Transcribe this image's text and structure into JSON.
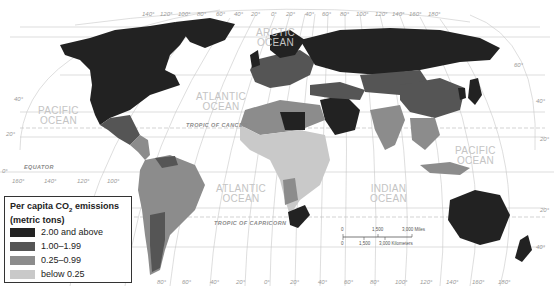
{
  "legend": {
    "title_prefix": "Per capita CO",
    "title_sub": "2",
    "title_suffix": " emissions",
    "subtitle": "(metric tons)",
    "items": [
      {
        "label": "2.00 and above",
        "color": "#222222"
      },
      {
        "label": "1.00–1.99",
        "color": "#555555"
      },
      {
        "label": "0.25–0.99",
        "color": "#8c8c8c"
      },
      {
        "label": "below 0.25",
        "color": "#c9c9c9"
      }
    ]
  },
  "oceans": {
    "pacific_west": [
      "PACIFIC",
      "OCEAN"
    ],
    "atlantic_north": [
      "ATLANTIC",
      "OCEAN"
    ],
    "arctic": [
      "ARCTIC",
      "OCEAN"
    ],
    "atlantic_south": [
      "ATLANTIC",
      "OCEAN"
    ],
    "indian": [
      "INDIAN",
      "OCEAN"
    ],
    "pacific_east": [
      "PACIFIC",
      "OCEAN"
    ]
  },
  "lines": {
    "tropic_cancer": "TROPIC OF CANCER",
    "tropic_capricorn": "TROPIC OF CAPRICORN",
    "equator": "EQUATOR"
  },
  "longitudes_top": [
    "140°",
    "120°",
    "100°",
    "80°",
    "60°",
    "40°",
    "20°",
    "0°",
    "20°",
    "40°",
    "60°",
    "80°",
    "100°",
    "120°",
    "140°",
    "160°",
    "180°"
  ],
  "longitudes_bottom": [
    "160°",
    "140°",
    "120°",
    "100°",
    "80°",
    "60°",
    "40°",
    "20°",
    "0°",
    "20°",
    "40°",
    "60°",
    "80°",
    "100°",
    "120°",
    "140°",
    "160°",
    "180°"
  ],
  "latitudes_left": [
    "40°",
    "20°",
    "0°",
    "40°"
  ],
  "latitudes_right": [
    "60°",
    "40°",
    "20°",
    "20°",
    "40°"
  ],
  "scale": {
    "miles_zero": "0",
    "miles_mid": "1,500",
    "miles_end": "3,000 Miles",
    "km_zero": "0",
    "km_mid": "1,500",
    "km_end": "3,000 Kilometers"
  },
  "colors": {
    "high": "#222222",
    "mid_high": "#555555",
    "mid_low": "#8c8c8c",
    "low": "#c9c9c9",
    "graticule": "#bdbdbd"
  }
}
